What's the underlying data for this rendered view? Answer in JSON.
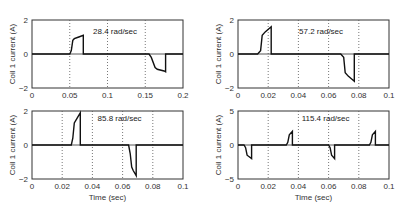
{
  "chart_data": [
    {
      "type": "line",
      "title": "",
      "annotation": "28.4 rad/sec",
      "xlabel": "",
      "ylabel": "Coil 1 current (A)",
      "xlim": [
        0,
        0.2
      ],
      "ylim": [
        -2,
        2
      ],
      "xticks": [
        "0",
        "0.05",
        "0.1",
        "0.15",
        "0.2"
      ],
      "yticks": [
        "2",
        "0",
        "-2"
      ],
      "grid": "vertical dotted",
      "series": [
        {
          "name": "coil1",
          "x": [
            0,
            0.05,
            0.052,
            0.054,
            0.056,
            0.062,
            0.068,
            0.068,
            0.155,
            0.158,
            0.163,
            0.166,
            0.175,
            0.177,
            0.177,
            0.2
          ],
          "y": [
            0,
            0,
            0.2,
            0.8,
            0.9,
            1.0,
            1.1,
            0,
            0,
            -0.2,
            -0.8,
            -0.9,
            -1.0,
            -1.05,
            0,
            0
          ]
        }
      ]
    },
    {
      "type": "line",
      "title": "",
      "annotation": "57.2 rad/sec",
      "xlabel": "",
      "ylabel": "Coil 1 current (A)",
      "xlim": [
        0,
        0.1
      ],
      "ylim": [
        -2,
        2
      ],
      "xticks": [
        "0",
        "0.02",
        "0.04",
        "0.06",
        "0.08",
        "0.1"
      ],
      "yticks": [
        "2",
        "0",
        "-2"
      ],
      "grid": "vertical dotted",
      "series": [
        {
          "name": "coil1",
          "x": [
            0,
            0.013,
            0.015,
            0.016,
            0.018,
            0.022,
            0.022,
            0.068,
            0.07,
            0.071,
            0.073,
            0.077,
            0.077,
            0.1
          ],
          "y": [
            0,
            0,
            0.2,
            1.1,
            1.3,
            1.6,
            0,
            0,
            -0.2,
            -1.1,
            -1.3,
            -1.6,
            0,
            0
          ]
        }
      ]
    },
    {
      "type": "line",
      "title": "",
      "annotation": "85.8 rad/sec",
      "xlabel": "Time (sec)",
      "ylabel": "Coil 1 current (A)",
      "xlim": [
        0,
        0.1
      ],
      "ylim": [
        -2,
        2
      ],
      "xticks": [
        "0",
        "0.02",
        "0.04",
        "0.06",
        "0.08",
        "0.1"
      ],
      "yticks": [
        "2",
        "0",
        "-2"
      ],
      "grid": "vertical dotted",
      "series": [
        {
          "name": "coil1",
          "x": [
            0,
            0.026,
            0.027,
            0.028,
            0.03,
            0.032,
            0.032,
            0.064,
            0.065,
            0.066,
            0.067,
            0.069,
            0.069,
            0.1
          ],
          "y": [
            0,
            0,
            0.4,
            1.3,
            1.6,
            1.9,
            0,
            0,
            -0.5,
            -1.3,
            -1.5,
            -1.8,
            0,
            0
          ]
        }
      ]
    },
    {
      "type": "line",
      "title": "",
      "annotation": "115.4 rad/sec",
      "xlabel": "Time (sec)",
      "ylabel": "Coil 1 current (A)",
      "xlim": [
        0,
        0.1
      ],
      "ylim": [
        -5,
        5
      ],
      "xticks": [
        "0",
        "0.02",
        "0.04",
        "0.06",
        "0.08",
        "0.1"
      ],
      "yticks": [
        "5",
        "0",
        "-5"
      ],
      "grid": "vertical dotted",
      "series": [
        {
          "name": "coil1",
          "x": [
            0,
            0.004,
            0.005,
            0.006,
            0.009,
            0.009,
            0.032,
            0.033,
            0.034,
            0.036,
            0.036,
            0.06,
            0.061,
            0.062,
            0.064,
            0.064,
            0.087,
            0.088,
            0.089,
            0.091,
            0.091,
            0.1
          ],
          "y": [
            0,
            0,
            -0.4,
            -1.5,
            -2.0,
            0,
            0,
            0.4,
            1.5,
            2.0,
            0,
            0,
            -0.4,
            -1.5,
            -2.0,
            0,
            0,
            0.4,
            1.5,
            2.0,
            0,
            0
          ]
        }
      ]
    }
  ]
}
